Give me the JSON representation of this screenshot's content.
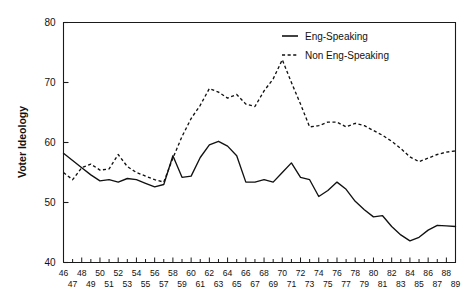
{
  "chart_data": {
    "type": "line",
    "title": "",
    "xlabel": "",
    "ylabel": "Voter Ideology",
    "ylim": [
      40,
      80
    ],
    "yticks": [
      40,
      50,
      60,
      70,
      80
    ],
    "xlim": [
      46,
      89
    ],
    "grid": false,
    "legend_position": "top-right-inside",
    "x": [
      46,
      47,
      48,
      49,
      50,
      51,
      52,
      53,
      54,
      55,
      56,
      57,
      58,
      59,
      60,
      61,
      62,
      63,
      64,
      65,
      66,
      67,
      68,
      69,
      70,
      71,
      72,
      73,
      74,
      75,
      76,
      77,
      78,
      79,
      80,
      81,
      82,
      83,
      84,
      85,
      86,
      87,
      88,
      89
    ],
    "xtick_labels_top": [
      "46",
      "48",
      "50",
      "52",
      "54",
      "56",
      "58",
      "60",
      "62",
      "64",
      "66",
      "68",
      "70",
      "72",
      "74",
      "76",
      "78",
      "80",
      "82",
      "84",
      "86",
      "88"
    ],
    "xtick_labels_bottom": [
      "47",
      "49",
      "51",
      "53",
      "55",
      "57",
      "59",
      "61",
      "63",
      "65",
      "67",
      "69",
      "71",
      "73",
      "75",
      "77",
      "79",
      "81",
      "83",
      "85",
      "87",
      "89"
    ],
    "series": [
      {
        "name": "Eng-Speaking",
        "style": "solid",
        "color": "#111111",
        "values": [
          58.2,
          57.0,
          55.8,
          54.6,
          53.6,
          53.8,
          53.4,
          54.0,
          53.8,
          53.2,
          52.6,
          53.0,
          57.8,
          54.2,
          54.4,
          57.5,
          59.6,
          60.2,
          59.4,
          57.8,
          53.4,
          53.4,
          53.8,
          53.4,
          55.0,
          56.6,
          54.2,
          53.8,
          51.0,
          52.0,
          53.4,
          52.2,
          50.2,
          48.8,
          47.6,
          47.8,
          46.0,
          44.6,
          43.6,
          44.2,
          45.4,
          46.2,
          46.1,
          46.0
        ]
      },
      {
        "name": "Non Eng-Speaking",
        "style": "dashed",
        "color": "#111111",
        "values": [
          55.0,
          53.8,
          55.8,
          56.4,
          55.4,
          55.6,
          58.0,
          56.0,
          55.0,
          54.4,
          53.8,
          53.4,
          57.4,
          61.0,
          64.0,
          66.2,
          69.0,
          68.4,
          67.4,
          68.0,
          66.4,
          66.0,
          68.6,
          70.6,
          73.8,
          70.0,
          66.4,
          62.6,
          62.8,
          63.4,
          63.4,
          62.6,
          63.2,
          62.8,
          62.0,
          61.2,
          60.2,
          59.0,
          57.6,
          56.8,
          57.4,
          58.0,
          58.4,
          58.6
        ]
      }
    ]
  },
  "legend": {
    "items": [
      {
        "label": "Eng-Speaking",
        "style": "solid"
      },
      {
        "label": "Non Eng-Speaking",
        "style": "dashed"
      }
    ]
  }
}
